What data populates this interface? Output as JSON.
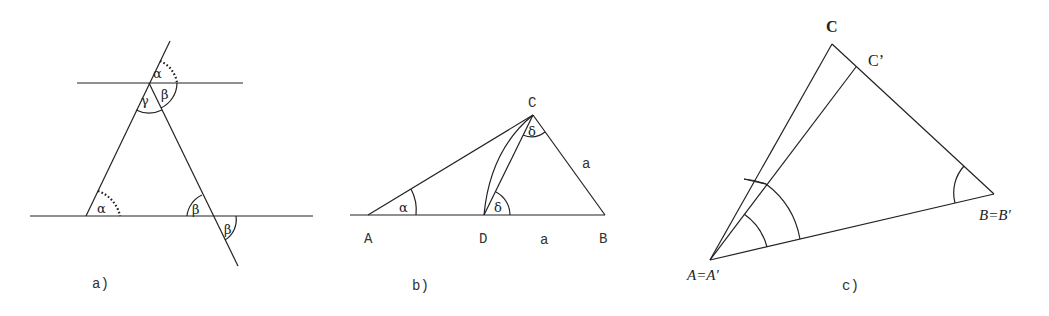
{
  "panels": {
    "a": {
      "caption": "a)",
      "angles": {
        "alpha_top": "α",
        "beta_top": "β",
        "gamma": "γ",
        "alpha_bottom": "α",
        "beta_bottom_left": "β",
        "beta_bottom_right": "β"
      }
    },
    "b": {
      "caption": "b)",
      "vertices": {
        "A": "A",
        "D": "D",
        "B": "B",
        "C": "C"
      },
      "sides": {
        "DB": "a",
        "CB": "a"
      },
      "angles": {
        "alpha": "α",
        "delta_C": "δ",
        "delta_D": "δ"
      }
    },
    "c": {
      "caption": "c)",
      "vertices": {
        "A": "A=A′",
        "B": "B=B′",
        "C": "C",
        "C_prime": "C’"
      }
    }
  }
}
